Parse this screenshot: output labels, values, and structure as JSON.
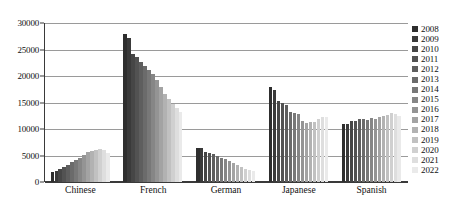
{
  "chart_data": {
    "type": "bar",
    "title": "",
    "subtitle": "",
    "xlabel": "",
    "ylabel": "",
    "categories": [
      "Chinese",
      "French",
      "German",
      "Japanese",
      "Spanish"
    ],
    "ylim": [
      0,
      30000
    ],
    "ytick_values": [
      0,
      5000,
      10000,
      15000,
      20000,
      25000,
      30000
    ],
    "ytick_labels": [
      "0",
      "5000",
      "10000",
      "15000",
      "20000",
      "25000",
      "30000"
    ],
    "grid": true,
    "legend_position": "right",
    "series": [
      {
        "name": "2008",
        "color": "#2e2e2e",
        "values": [
          1800,
          28000,
          6500,
          18000,
          11000
        ]
      },
      {
        "name": "2009",
        "color": "#3a3a3a",
        "values": [
          2100,
          27100,
          6400,
          17300,
          10900
        ]
      },
      {
        "name": "2010",
        "color": "#464646",
        "values": [
          2500,
          24100,
          5700,
          15200,
          11600
        ]
      },
      {
        "name": "2011",
        "color": "#525252",
        "values": [
          2900,
          23600,
          5500,
          15000,
          11500
        ]
      },
      {
        "name": "2012",
        "color": "#5e5e5e",
        "values": [
          3300,
          22600,
          5200,
          14600,
          11800
        ]
      },
      {
        "name": "2013",
        "color": "#6b6b6b",
        "values": [
          3700,
          21800,
          4900,
          13200,
          11900
        ]
      },
      {
        "name": "2014",
        "color": "#787878",
        "values": [
          4100,
          21100,
          4600,
          13100,
          11700
        ]
      },
      {
        "name": "2015",
        "color": "#868686",
        "values": [
          4500,
          20300,
          4400,
          12900,
          12000
        ]
      },
      {
        "name": "2016",
        "color": "#949494",
        "values": [
          5100,
          19300,
          4000,
          11600,
          11800
        ]
      },
      {
        "name": "2017",
        "color": "#a3a3a3",
        "values": [
          5600,
          17900,
          3600,
          11200,
          12200
        ]
      },
      {
        "name": "2018",
        "color": "#b2b2b2",
        "values": [
          5900,
          16700,
          3200,
          11400,
          12500
        ]
      },
      {
        "name": "2019",
        "color": "#c1c1c1",
        "values": [
          6100,
          15600,
          2800,
          11300,
          12700
        ]
      },
      {
        "name": "2020",
        "color": "#d0d0d0",
        "values": [
          6200,
          14700,
          2500,
          11900,
          13000
        ]
      },
      {
        "name": "2021",
        "color": "#dedede",
        "values": [
          6000,
          13900,
          2200,
          12300,
          12900
        ]
      },
      {
        "name": "2022",
        "color": "#eaeaea",
        "values": [
          5500,
          13300,
          2000,
          12200,
          12500
        ]
      }
    ]
  },
  "caption": {
    "text": ""
  }
}
